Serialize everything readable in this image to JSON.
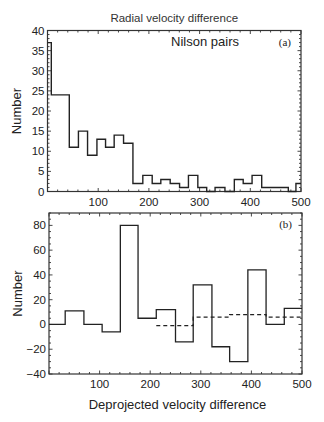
{
  "chart_data": [
    {
      "type": "bar",
      "style": "step-histogram",
      "panel": "(a)",
      "title": "Radial velocity difference",
      "annotation": "Nilson pairs",
      "xlabel": "",
      "ylabel": "Number",
      "xlim": [
        0,
        500
      ],
      "ylim": [
        0,
        40
      ],
      "xticks": [
        100,
        200,
        300,
        400,
        500
      ],
      "yticks": [
        0,
        5,
        10,
        15,
        20,
        25,
        30,
        35,
        40
      ],
      "grid": false,
      "bin_edges": [
        0,
        7.5,
        25.5,
        43,
        61,
        79,
        97.5,
        114.5,
        131.5,
        150,
        168.5,
        188,
        206.5,
        223.5,
        242,
        260.5,
        278,
        296.5,
        314,
        330.5,
        350,
        368.5,
        386,
        403.5,
        422.5,
        441,
        458.5,
        475,
        490,
        500
      ],
      "values": [
        37,
        24,
        24,
        11,
        15,
        9,
        13,
        11,
        14,
        12,
        2,
        4,
        2,
        3,
        2,
        1,
        4,
        1,
        0,
        1,
        0,
        3,
        2,
        4,
        1,
        1,
        1,
        0,
        2
      ]
    },
    {
      "type": "bar",
      "style": "step-histogram",
      "panel": "(b)",
      "title": "",
      "xlabel": "Deprojected velocity  difference",
      "ylabel": "Number",
      "xlim": [
        0,
        500
      ],
      "ylim": [
        -40,
        90
      ],
      "xticks": [
        100,
        200,
        300,
        400,
        500
      ],
      "yticks": [
        -40,
        -20,
        0,
        20,
        40,
        60,
        80
      ],
      "grid": false,
      "series": [
        {
          "name": "solid",
          "line": "solid",
          "bin_edges": [
            0,
            32,
            69,
            105,
            141,
            176,
            212,
            250,
            285,
            322,
            357,
            393,
            429,
            465,
            500
          ],
          "values": [
            0,
            11,
            0,
            -6,
            80,
            5,
            12,
            -14,
            32,
            -18,
            -30,
            44,
            0,
            13
          ]
        },
        {
          "name": "dashed",
          "line": "dashed",
          "bin_edges": [
            212,
            285,
            357,
            429,
            500
          ],
          "values": [
            -1,
            6,
            8,
            6
          ]
        }
      ]
    }
  ]
}
